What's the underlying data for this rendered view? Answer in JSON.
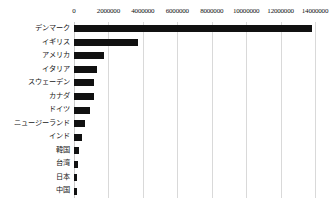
{
  "chart_data": {
    "type": "bar",
    "orientation": "horizontal",
    "title": "",
    "xlabel": "",
    "ylabel": "",
    "xlim": [
      0,
      14000000
    ],
    "grid": true,
    "legend": false,
    "axis_position": "top",
    "bar_color": "#111111",
    "grid_color": "#d9d9d9",
    "xticks": [
      0,
      2000000,
      4000000,
      6000000,
      8000000,
      10000000,
      12000000,
      14000000
    ],
    "xticklabels": [
      "0",
      "2000000",
      "4000000",
      "6000000",
      "8000000",
      "10000000",
      "12000000",
      "14000000"
    ],
    "categories": [
      "デンマーク",
      "イギリス",
      "アメリカ",
      "イタリア",
      "スウェーデン",
      "カナダ",
      "ドイツ",
      "ニュージーランド",
      "インド",
      "韓国",
      "台湾",
      "日本",
      "中国"
    ],
    "values": [
      13800000,
      3730000,
      1730000,
      1350000,
      1190000,
      1140000,
      940000,
      650000,
      440000,
      290000,
      230000,
      200000,
      150000
    ]
  },
  "caption": {
    "text": ""
  }
}
